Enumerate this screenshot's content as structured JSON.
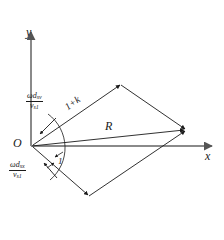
{
  "figure": {
    "type": "vector-parallelogram-diagram",
    "background": "#ffffff",
    "stroke_color": "#1a1a1a",
    "axis_color": "#7a7a7a",
    "axes": {
      "y_label": "y",
      "x_label": "x",
      "origin_label": "O"
    },
    "labels": {
      "resultant": "R",
      "side_upper": "1+k",
      "angle": "1"
    },
    "fractions": [
      {
        "name": "omega-d-sv-over-v-s1",
        "numerator_main": "ωd",
        "numerator_sub": "sv",
        "denominator_main": "v",
        "denominator_sub": "s1"
      },
      {
        "name": "omega-d-sx-over-v-s1",
        "numerator_main": "ωd",
        "numerator_sub": "sx",
        "denominator_main": "v",
        "denominator_sub": "s1"
      }
    ],
    "geometry": {
      "origin": [
        31,
        146
      ],
      "vertex_top": [
        121,
        84
      ],
      "vertex_right": [
        186,
        130
      ],
      "vertex_bottom": [
        89,
        196
      ],
      "y_axis_top": [
        31,
        30
      ],
      "x_axis_right": [
        213,
        146
      ]
    }
  }
}
